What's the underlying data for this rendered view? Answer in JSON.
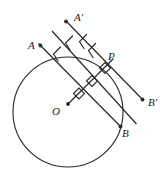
{
  "figure": {
    "type": "geometry-diagram",
    "width": 167,
    "height": 171,
    "stroke_color": "#2b2b2b",
    "background_color": "#ffffff",
    "circle": {
      "center_label": "O",
      "cx": 68,
      "cy": 112,
      "r": 55
    },
    "labels": [
      {
        "id": "A-prime",
        "text": "A'",
        "x": 74,
        "y": 12
      },
      {
        "id": "A",
        "text": "A",
        "x": 28,
        "y": 40
      },
      {
        "id": "P",
        "text": "P",
        "x": 108,
        "y": 52
      },
      {
        "id": "B-prime",
        "text": "B'",
        "x": 148,
        "y": 98
      },
      {
        "id": "O",
        "text": "O",
        "x": 53,
        "y": 106
      },
      {
        "id": "B",
        "text": "B",
        "x": 123,
        "y": 128
      }
    ],
    "lines": [
      {
        "id": "line-A-prime-B-prime",
        "x1": 66,
        "y1": 21,
        "x2": 143,
        "y2": 100,
        "arrow_count": 2
      },
      {
        "id": "line-middle",
        "x1": 53,
        "y1": 32,
        "x2": 136,
        "y2": 124,
        "arrow_count": 1
      },
      {
        "id": "line-A-B",
        "x1": 38,
        "y1": 43,
        "x2": 120,
        "y2": 126,
        "arrow_count": 1
      }
    ],
    "radius_line": {
      "id": "line-O-P",
      "x1": 68,
      "y1": 104,
      "x2": 112,
      "y2": 60
    },
    "right_angle_marks": [
      {
        "id": "right-angle-at-P",
        "cx": 105,
        "cy": 69
      },
      {
        "id": "right-angle-middle",
        "cx": 92,
        "cy": 82
      },
      {
        "id": "right-angle-lower",
        "cx": 79,
        "cy": 94
      }
    ],
    "endpoint_dots": [
      {
        "id": "dot-A-prime",
        "cx": 66,
        "cy": 21
      },
      {
        "id": "dot-A",
        "cx": 40,
        "cy": 45
      },
      {
        "id": "dot-B-prime",
        "cx": 143,
        "cy": 100
      },
      {
        "id": "dot-B",
        "cx": 120,
        "cy": 126
      },
      {
        "id": "dot-O",
        "cx": 68,
        "cy": 104
      }
    ]
  }
}
